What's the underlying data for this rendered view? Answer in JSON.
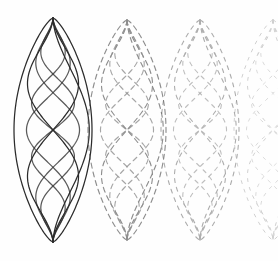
{
  "figure": {
    "title": "Standing wave lens packets",
    "background_color": "#fefefe",
    "width": 278,
    "height": 261,
    "ink_color": "#2b2b2b"
  },
  "chart_data": {
    "type": "line",
    "title": "Standing wave lens packets",
    "subtitle": "",
    "xlabel": "",
    "ylabel": "",
    "xlim": [
      0,
      278
    ],
    "ylim": [
      0,
      261
    ],
    "grid": false,
    "legend_position": "none",
    "annotations": [],
    "packets": [
      {
        "name": "packet-1",
        "center_x": 53,
        "top_y": 18,
        "bottom_y": 242,
        "half_width": 39,
        "stroke": "#2b2b2b",
        "opacity": 1.0,
        "dash": "none",
        "stroke_width": 1.25,
        "modes": [
          1,
          2,
          3,
          4
        ]
      },
      {
        "name": "packet-2",
        "center_x": 127,
        "top_y": 20,
        "bottom_y": 240,
        "half_width": 39,
        "stroke": "#4a4a4a",
        "opacity": 0.62,
        "dash": "5 4",
        "stroke_width": 1.15,
        "modes": [
          1,
          2,
          3,
          4
        ]
      },
      {
        "name": "packet-3",
        "center_x": 200,
        "top_y": 20,
        "bottom_y": 240,
        "half_width": 39,
        "stroke": "#5c5c5c",
        "opacity": 0.5,
        "dash": "4 5",
        "stroke_width": 1.1,
        "modes": [
          1,
          2,
          3,
          4
        ]
      },
      {
        "name": "packet-4-partial",
        "center_x": 273,
        "top_y": 20,
        "bottom_y": 240,
        "half_width": 39,
        "stroke": "#707070",
        "opacity": 0.32,
        "dash": "3 6",
        "stroke_width": 1.0,
        "modes": [
          1,
          2,
          3,
          4
        ]
      }
    ],
    "series": [
      {
        "name": "envelope-left",
        "mode": 0,
        "values": []
      },
      {
        "name": "envelope-right",
        "mode": 0,
        "values": []
      },
      {
        "name": "mode-1-antinode",
        "mode": 1,
        "values": []
      },
      {
        "name": "mode-2-antinode",
        "mode": 2,
        "values": []
      },
      {
        "name": "mode-3-antinode",
        "mode": 3,
        "values": []
      },
      {
        "name": "mode-4-antinode",
        "mode": 4,
        "values": []
      }
    ]
  }
}
